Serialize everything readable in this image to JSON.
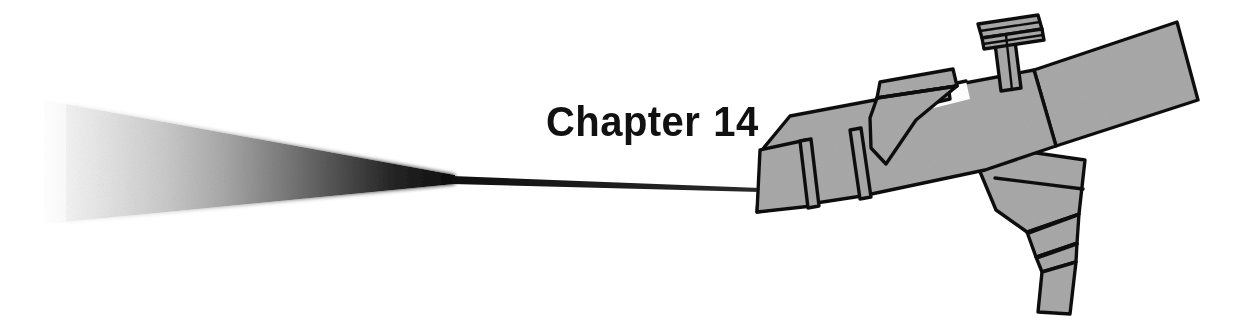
{
  "page": {
    "kind": "book-chapter-opener",
    "width": 1250,
    "height": 317,
    "background_color": "#ffffff"
  },
  "heading": {
    "full_text": "Chapter 14",
    "label": "Chapter",
    "number": "14",
    "color": "#111111"
  },
  "illustration": {
    "name": "paint-spray-gun-with-spray-plume",
    "style": "black-and-white line art with flat gray fill",
    "colors": {
      "body_gray": "#a8a8a8",
      "body_gray_shadow": "#9a9a9a",
      "outline": "#111111",
      "plume_dark": "#0d0d0d",
      "plume_light": "#f2f2f2",
      "white": "#ffffff"
    },
    "parts": [
      {
        "name": "spray-plume",
        "description": "wedge-shaped fan of atomized spray fading from black at the nozzle to near white at the wide left end"
      },
      {
        "name": "spray-jet-line",
        "description": "thin tapered line joining the nozzle tip to the plume apex"
      },
      {
        "name": "nozzle-tip",
        "description": "angled front cap of the gun barrel"
      },
      {
        "name": "nozzle-ring-front",
        "description": "raised collar band near the tip"
      },
      {
        "name": "nozzle-ring-rear",
        "description": "second raised collar band behind the first"
      },
      {
        "name": "barrel",
        "description": "main tapered body of the spray gun angled up to the right"
      },
      {
        "name": "fan-adjust-fin",
        "description": "wing-shaped fin mounted on top of the barrel"
      },
      {
        "name": "adjustment-knob",
        "description": "mushroom shaped knurled knob on a shaft on top of the body"
      },
      {
        "name": "handle",
        "description": "flat rectangular grip bar extending to the upper right"
      },
      {
        "name": "hose-fitting",
        "description": "stepped connector tapering downward below the body"
      },
      {
        "name": "hose-stem",
        "description": "narrow straight outlet at the bottom of the fitting"
      }
    ]
  }
}
